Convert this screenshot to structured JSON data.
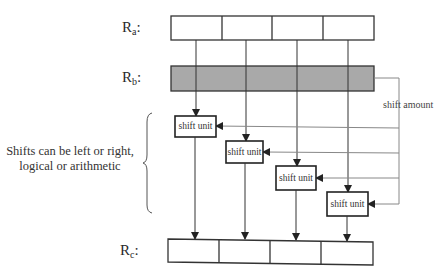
{
  "registers": {
    "ra": {
      "label": "R",
      "sub": "a",
      "colon": ":"
    },
    "rb": {
      "label": "R",
      "sub": "b",
      "colon": ":"
    },
    "rc": {
      "label": "R",
      "sub": "c",
      "colon": ":"
    }
  },
  "register_cells": 4,
  "shift_amount_label": "shift amount",
  "shift_units": [
    {
      "label": "shift unit"
    },
    {
      "label": "shift unit"
    },
    {
      "label": "shift unit"
    },
    {
      "label": "shift unit"
    }
  ],
  "note": {
    "line1": "Shifts can be left or right,",
    "line2": "logical or arithmetic"
  },
  "colors": {
    "stroke": "#333333",
    "rb_fill": "#a9a9a9",
    "thin_line": "#888888"
  }
}
